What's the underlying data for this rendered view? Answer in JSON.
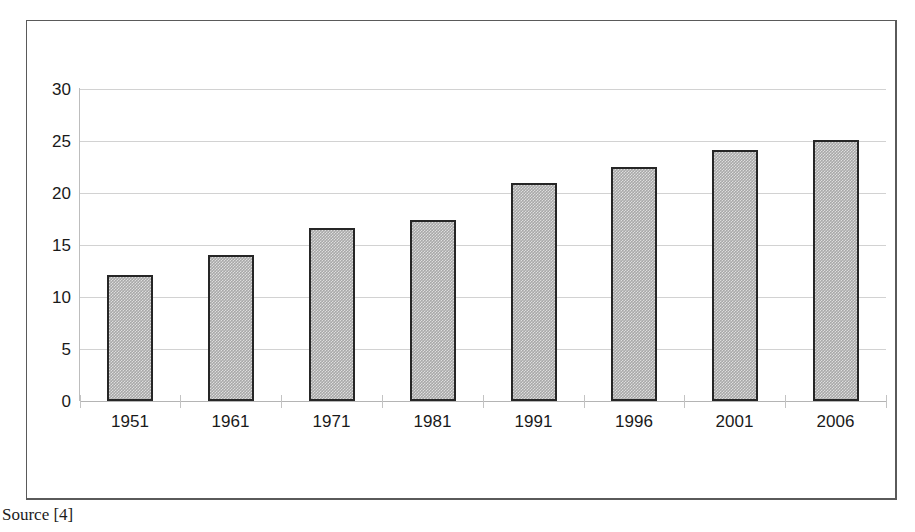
{
  "figure": {
    "source_caption": "Source [4]",
    "frame_color": "#5a5a5a",
    "bar_fill_color": "#a8a8a8",
    "bar_border_color": "#262626",
    "gridline_color": "#d2d2d2"
  },
  "chart_data": {
    "type": "bar",
    "title": "",
    "subtitle": "",
    "xlabel": "",
    "ylabel": "",
    "categories": [
      "1951",
      "1961",
      "1971",
      "1981",
      "1991",
      "1996",
      "2001",
      "2006"
    ],
    "values": [
      12.1,
      14.0,
      16.6,
      17.4,
      21.0,
      22.5,
      24.1,
      25.1
    ],
    "ylim": [
      0,
      30
    ],
    "ytick_labels": [
      "30",
      "25",
      "20",
      "15",
      "10",
      "5",
      "0"
    ],
    "ytick_values": [
      30,
      25,
      20,
      15,
      10,
      5,
      0
    ],
    "ytick_interval": 5,
    "grid": "horizontal",
    "legend": "none",
    "annotations": [
      "Source [4]"
    ]
  }
}
